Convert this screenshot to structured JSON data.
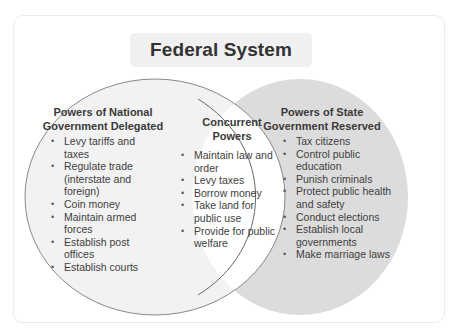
{
  "title": "Federal System",
  "national": {
    "heading_line1": "Powers of National",
    "heading_line2": "Government Delegated",
    "items": [
      "Levy tariffs and taxes",
      "Regulate trade (interstate and foreign)",
      "Coin money",
      "Maintain armed forces",
      "Establish post offices",
      "Establish courts"
    ]
  },
  "concurrent": {
    "heading_line1": "Concurrent",
    "heading_line2": "Powers",
    "items": [
      "Maintain law and order",
      "Levy taxes",
      "Borrow money",
      "Take land for public use",
      "Provide for public welfare"
    ]
  },
  "state": {
    "heading_line1": "Powers of State",
    "heading_line2": "Government Reserved",
    "items": [
      "Tax citizens",
      "Control public education",
      "Punish criminals",
      "Protect public health and safety",
      "Conduct elections",
      "Establish local governments",
      "Make marriage laws"
    ]
  },
  "colors": {
    "left_circle_fill": "#f2f2f2",
    "right_circle_fill": "#dcdcdc",
    "overlap_fill": "#ffffff",
    "outline": "#7a7a7a"
  }
}
